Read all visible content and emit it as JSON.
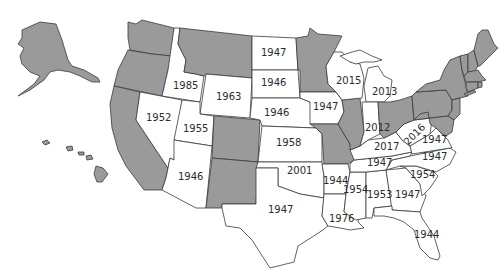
{
  "map": {
    "title": "",
    "colors": {
      "shaded": "#9a9a9a",
      "unshaded": "#ffffff",
      "border": "#3a3a3a",
      "text": "#2b2b2b"
    },
    "labels": {
      "north_dakota": "1947",
      "south_dakota": "1946",
      "nebraska": "1946",
      "kansas": "1958",
      "oklahoma": "2001",
      "texas": "1947",
      "idaho": "1985",
      "wyoming": "1963",
      "nevada": "1952",
      "utah": "1955",
      "arizona": "1946",
      "iowa": "1947",
      "wisconsin": "2015",
      "michigan": "2013",
      "indiana": "2012",
      "kentucky": "2017",
      "west_virginia": "2016",
      "virginia": "1947",
      "north_carolina": "1947",
      "tennessee": "1947",
      "arkansas": "1944",
      "louisiana": "1976",
      "mississippi": "1954",
      "alabama": "1953",
      "georgia": "1947",
      "south_carolina": "1954",
      "florida": "1944"
    },
    "shaded_states": [
      "Alaska",
      "Hawaii",
      "Washington",
      "Oregon",
      "California",
      "Montana",
      "Colorado",
      "New Mexico",
      "Minnesota",
      "Missouri",
      "Illinois",
      "Ohio",
      "Pennsylvania",
      "New York",
      "New Jersey",
      "Delaware",
      "Maryland",
      "Connecticut",
      "Rhode Island",
      "Massachusetts",
      "Vermont",
      "New Hampshire",
      "Maine"
    ]
  }
}
